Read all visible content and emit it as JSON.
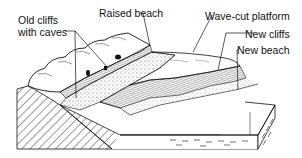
{
  "diagram": {
    "labels": [
      {
        "id": "old-cliffs",
        "line1": "Old cliffs",
        "line2": "with caves"
      },
      {
        "id": "raised-beach",
        "text": "Raised beach"
      },
      {
        "id": "wave-cut-platform",
        "text": "Wave-cut platform"
      },
      {
        "id": "new-cliffs",
        "text": "New cliffs"
      },
      {
        "id": "new-beach",
        "text": "New beach"
      }
    ],
    "colors": {
      "ink": "#111111",
      "background": "#ffffff"
    }
  }
}
